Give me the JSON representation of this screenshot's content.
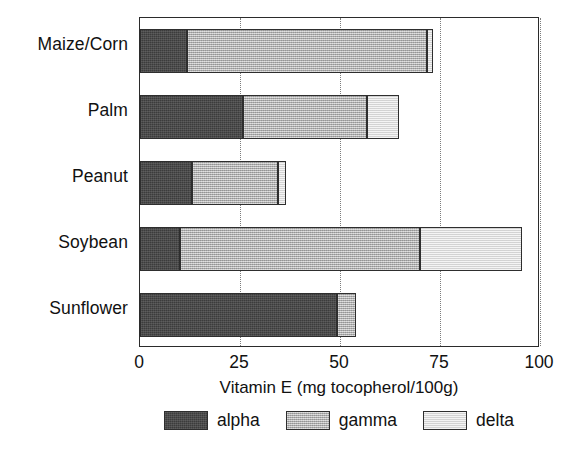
{
  "chart_data": {
    "type": "bar",
    "orientation": "horizontal",
    "stacked": true,
    "title": "",
    "xlabel": "Vitamin E (mg tocopherol/100g)",
    "ylabel": "",
    "xlim": [
      0,
      100
    ],
    "xticks": [
      0,
      25,
      50,
      75,
      100
    ],
    "xticklabels": [
      "0",
      "25",
      "50",
      "75",
      "100"
    ],
    "grid": "vertical-dotted",
    "legend_position": "below-axis",
    "categories": [
      "Maize/Corn",
      "Palm",
      "Peanut",
      "Soybean",
      "Sunflower"
    ],
    "series": [
      {
        "name": "alpha",
        "color": "#3c3c3c",
        "values": [
          11.7,
          25.7,
          13.0,
          10.0,
          49.3
        ]
      },
      {
        "name": "gamma",
        "color": "#b3b3b3",
        "values": [
          60.0,
          31.0,
          21.5,
          60.0,
          4.7
        ]
      },
      {
        "name": "delta",
        "color": "#e4e4e4",
        "values": [
          1.5,
          8.0,
          2.0,
          25.5,
          0.0
        ]
      }
    ],
    "totals": [
      73.2,
      64.7,
      36.5,
      95.5,
      54.0
    ]
  },
  "axis": {
    "x_label": "Vitamin E (mg tocopherol/100g)",
    "ticks": [
      "0",
      "25",
      "50",
      "75",
      "100"
    ]
  },
  "legend": {
    "items": [
      {
        "label": "alpha",
        "color": "#3c3c3c"
      },
      {
        "label": "gamma",
        "color": "#b3b3b3"
      },
      {
        "label": "delta",
        "color": "#e4e4e4"
      }
    ]
  },
  "caption": {
    "text": ""
  }
}
